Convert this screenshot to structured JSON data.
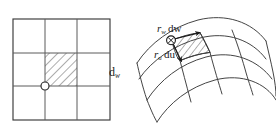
{
  "figure": {
    "background_color": "#ffffff",
    "stroke_color": "#3a3a3a",
    "hatch_color": "#4a4a4a",
    "label_color": "#1a1a1a"
  },
  "left_panel": {
    "name": "parameter-domain-grid",
    "description": "square 3 by 3 grid in parameter space",
    "rows": 3,
    "columns": 3,
    "square": {
      "x": 13,
      "y": 19,
      "width": 97,
      "height": 101
    },
    "grid_lines_vertical": [
      45,
      77
    ],
    "grid_lines_horizontal": [
      53,
      86
    ],
    "highlighted_cell": {
      "x": 45,
      "y": 53,
      "width": 32,
      "height": 33,
      "fill": "hatched"
    },
    "vertex_marker": {
      "x": 45,
      "y": 86,
      "radius": 4,
      "style": "open-circle"
    },
    "label": {
      "text": "d",
      "subscript": "w",
      "x": 109,
      "y": 66
    }
  },
  "right_panel": {
    "name": "curved-surface-patch",
    "description": "curvilinear mesh patch on a mapped surface",
    "rows": 3,
    "columns": 3,
    "highlighted_cell": {
      "fill": "hatched"
    },
    "point_marker": {
      "x": 171,
      "y": 40,
      "radius": 4.5,
      "style": "crossed-circle"
    },
    "vectors": [
      {
        "name": "r-w-dw-vector",
        "label": "r",
        "subscript": "w",
        "differential": "dw",
        "from": {
          "x": 171,
          "y": 40
        },
        "to": {
          "x": 199,
          "y": 33
        }
      },
      {
        "name": "r-u-du-vector",
        "label": "r",
        "subscript": "u",
        "differential": "du",
        "from": {
          "x": 171,
          "y": 40
        },
        "to": {
          "x": 189,
          "y": 60
        }
      }
    ],
    "labels": {
      "rw_dw": {
        "text": "r",
        "subscript": "w",
        "differential": "dw",
        "x": 157,
        "y": 23
      },
      "ru_du": {
        "text": "r",
        "subscript": "u",
        "differential": "du",
        "x": 154,
        "y": 49
      }
    }
  }
}
